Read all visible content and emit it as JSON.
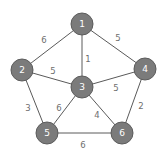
{
  "graph": {
    "nodes": [
      {
        "id": "1",
        "label": "1",
        "x": 82,
        "y": 24
      },
      {
        "id": "2",
        "label": "2",
        "x": 22,
        "y": 70
      },
      {
        "id": "3",
        "label": "3",
        "x": 82,
        "y": 87
      },
      {
        "id": "4",
        "label": "4",
        "x": 145,
        "y": 69
      },
      {
        "id": "5",
        "label": "5",
        "x": 47,
        "y": 133
      },
      {
        "id": "6",
        "label": "6",
        "x": 122,
        "y": 133
      }
    ],
    "edges": [
      {
        "from": "1",
        "to": "2",
        "weight": "6",
        "lx": 44,
        "ly": 40
      },
      {
        "from": "1",
        "to": "4",
        "weight": "5",
        "lx": 118,
        "ly": 38
      },
      {
        "from": "1",
        "to": "3",
        "weight": "1",
        "lx": 88,
        "ly": 59
      },
      {
        "from": "2",
        "to": "3",
        "weight": "5",
        "lx": 53,
        "ly": 71
      },
      {
        "from": "3",
        "to": "4",
        "weight": "5",
        "lx": 116,
        "ly": 88
      },
      {
        "from": "2",
        "to": "5",
        "weight": "3",
        "lx": 28,
        "ly": 108
      },
      {
        "from": "3",
        "to": "5",
        "weight": "6",
        "lx": 59,
        "ly": 108
      },
      {
        "from": "3",
        "to": "6",
        "weight": "4",
        "lx": 97,
        "ly": 115
      },
      {
        "from": "4",
        "to": "6",
        "weight": "2",
        "lx": 141,
        "ly": 106
      },
      {
        "from": "5",
        "to": "6",
        "weight": "6",
        "lx": 83,
        "ly": 145
      }
    ],
    "node_radius": 11,
    "colors": {
      "node_fill": "#7b7b7b",
      "node_stroke": "#5c5c5c",
      "edge": "#5a5a5a",
      "edge_label": "#6e6e6e",
      "node_label": "#ffffff"
    }
  }
}
